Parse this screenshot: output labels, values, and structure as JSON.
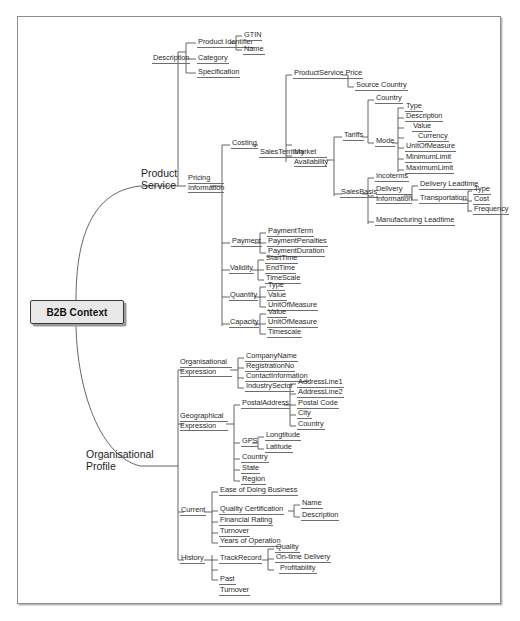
{
  "diagram": {
    "title": "B2B Context",
    "root": {
      "label": "B2B Context"
    },
    "colors": {
      "root_fill": "#e8e8e8",
      "root_border": "#3a3a3a",
      "line": "#555555",
      "frame": "#8d8d8d",
      "text": "#2a2a2a"
    },
    "branches": [
      {
        "label": "Product Service",
        "line1": "Product",
        "line2": "Service",
        "children": [
          {
            "label": "Description",
            "children": [
              {
                "label": "Product Identifier",
                "children": [
                  {
                    "label": "GTIN"
                  },
                  {
                    "label": "Name"
                  }
                ]
              },
              {
                "label": "Category"
              },
              {
                "label": "Specification"
              }
            ]
          },
          {
            "label": "Pricing Information",
            "line1": "Pricing",
            "line2": "Information",
            "children": [
              {
                "label": "Costing",
                "children": [
                  {
                    "label": "SalesTerritory",
                    "children": [
                      {
                        "label": "ProductService Price",
                        "children": [
                          {
                            "label": "Source Country"
                          }
                        ]
                      },
                      {
                        "label": "Market Availability",
                        "line1": "Market",
                        "line2": "Availability",
                        "children": [
                          {
                            "label": "Tariffs",
                            "children": [
                              {
                                "label": "Country"
                              },
                              {
                                "label": "Mode",
                                "children": [
                                  {
                                    "label": "Type"
                                  },
                                  {
                                    "label": "Description"
                                  },
                                  {
                                    "label": "Value"
                                  },
                                  {
                                    "label": "Currency"
                                  },
                                  {
                                    "label": "UnitOfMeasure"
                                  },
                                  {
                                    "label": "MinimumLimit"
                                  },
                                  {
                                    "label": "MaximumLimit"
                                  }
                                ]
                              }
                            ]
                          },
                          {
                            "label": "SalesBasis",
                            "children": [
                              {
                                "label": "Incoterms"
                              },
                              {
                                "label": "Delivery Information",
                                "line1": "Delivery",
                                "line2": "Information",
                                "children": [
                                  {
                                    "label": "Delivery Leadtime"
                                  },
                                  {
                                    "label": "Transportation",
                                    "children": [
                                      {
                                        "label": "Type"
                                      },
                                      {
                                        "label": "Cost"
                                      },
                                      {
                                        "label": "Frequency"
                                      }
                                    ]
                                  }
                                ]
                              },
                              {
                                "label": "Manufacturing Leadtime"
                              }
                            ]
                          }
                        ]
                      }
                    ]
                  }
                ]
              },
              {
                "label": "Payment",
                "children": [
                  {
                    "label": "PaymentTerm"
                  },
                  {
                    "label": "PaymentPenalties"
                  },
                  {
                    "label": "PaymentDuration"
                  }
                ]
              },
              {
                "label": "Validity",
                "children": [
                  {
                    "label": "StartTime"
                  },
                  {
                    "label": "EndTime"
                  },
                  {
                    "label": "TimeScale"
                  }
                ]
              },
              {
                "label": "Quantity",
                "children": [
                  {
                    "label": "Type"
                  },
                  {
                    "label": "Value"
                  },
                  {
                    "label": "UnitOfMeasure"
                  }
                ]
              },
              {
                "label": "Capacity",
                "children": [
                  {
                    "label": "Value"
                  },
                  {
                    "label": "UnitOfMeasure"
                  },
                  {
                    "label": "Timescale"
                  }
                ]
              }
            ]
          }
        ]
      },
      {
        "label": "Organisational Profile",
        "line1": "Organisational",
        "line2": "Profile",
        "children": [
          {
            "label": "Organisational Expression",
            "line1": "Organisational",
            "line2": "Expression",
            "children": [
              {
                "label": "CompanyName"
              },
              {
                "label": "RegistrationNo"
              },
              {
                "label": "ContactInformation"
              },
              {
                "label": "IndustrySector"
              }
            ]
          },
          {
            "label": "Geographical Expression",
            "line1": "Geographical",
            "line2": "Expression",
            "children": [
              {
                "label": "PostalAddress",
                "children": [
                  {
                    "label": "AddressLine1"
                  },
                  {
                    "label": "AddressLine2"
                  },
                  {
                    "label": "Postal Code"
                  },
                  {
                    "label": "City"
                  },
                  {
                    "label": "Country"
                  }
                ]
              },
              {
                "label": "GPS",
                "children": [
                  {
                    "label": "Longtitude"
                  },
                  {
                    "label": "Latitude"
                  }
                ]
              },
              {
                "label": "Country"
              },
              {
                "label": "State"
              },
              {
                "label": "Region"
              }
            ]
          },
          {
            "label": "Current",
            "children": [
              {
                "label": "Ease of Doing Business"
              },
              {
                "label": "Quality Certification",
                "children": [
                  {
                    "label": "Name"
                  },
                  {
                    "label": "Description"
                  }
                ]
              },
              {
                "label": "Financial Rating"
              },
              {
                "label": "Turnover"
              },
              {
                "label": "Years of Operation"
              }
            ]
          },
          {
            "label": "History",
            "children": [
              {
                "label": "TrackRecord",
                "children": [
                  {
                    "label": "Quality"
                  },
                  {
                    "label": "On-time Delivery"
                  },
                  {
                    "label": "Profitability"
                  }
                ]
              },
              {
                "label": "Past"
              },
              {
                "label": "Turnover"
              }
            ]
          }
        ]
      }
    ]
  }
}
